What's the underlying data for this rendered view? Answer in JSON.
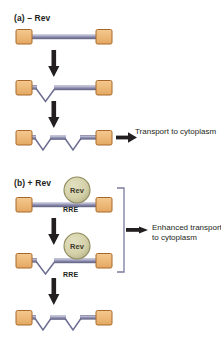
{
  "figure": {
    "type": "diagram",
    "background_color": "#ffffff",
    "colors": {
      "exon_box_fill": "#eeb877",
      "exon_box_stroke": "#a8692a",
      "rna_line": "#7b7b9e",
      "rna_line_highlight": "#b9b9d2",
      "rna_line_dark": "#4a4a70",
      "rev_fill": "#d5d2ab",
      "rev_stroke": "#8d8a5c",
      "arrow": "#231f20",
      "bracket": "#6b6b8a",
      "text": "#231f20"
    }
  },
  "panels": [
    {
      "id": "a",
      "label": "(a)  – Rev",
      "label_prefix": "(a)",
      "label_condition": "– Rev",
      "caption": "Transport to cytoplasm",
      "steps": [
        {
          "name": "unspliced-transcript",
          "introns": 0
        },
        {
          "name": "singly-spliced-transcript",
          "introns": 1
        },
        {
          "name": "fully-spliced-transcript",
          "introns": 2
        }
      ]
    },
    {
      "id": "b",
      "label": "(b)  + Rev",
      "label_prefix": "(b)",
      "label_condition": "+ Rev",
      "caption_line1": "Enhanced transport",
      "caption_line2": "to cytoplasm",
      "rev_protein_label": "Rev",
      "rre_label": "RRE",
      "steps": [
        {
          "name": "unspliced-transcript-rev-bound",
          "introns": 0,
          "rev_bound": true,
          "rre": "RRE"
        },
        {
          "name": "singly-spliced-transcript-rev-bound",
          "introns": 1,
          "rev_bound": true,
          "rre": "RRE"
        },
        {
          "name": "fully-spliced-transcript",
          "introns": 2,
          "rev_bound": false
        }
      ]
    }
  ]
}
